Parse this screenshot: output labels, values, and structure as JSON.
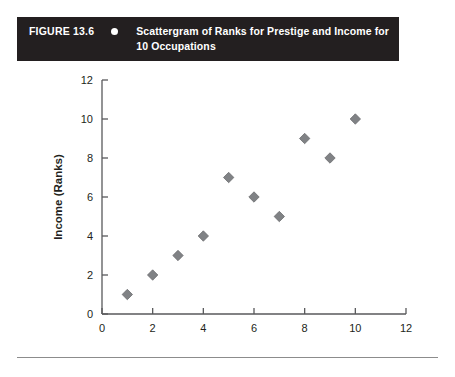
{
  "figure": {
    "number": "FIGURE 13.6",
    "bullet_icon": "bullet-dot-icon",
    "title": "Scattergram of Ranks for Prestige and Income for 10 Occupations"
  },
  "chart_data": {
    "type": "scatter",
    "title": "",
    "xlabel": "Prestige (Ranks)",
    "ylabel": "Income (Ranks)",
    "xlim": [
      0,
      12
    ],
    "ylim": [
      0,
      12
    ],
    "xticks": [
      0,
      2,
      4,
      6,
      8,
      10,
      12
    ],
    "yticks": [
      0,
      2,
      4,
      6,
      8,
      10,
      12
    ],
    "xtick_labels": [
      "0",
      "2",
      "4",
      "6",
      "8",
      "10",
      "12"
    ],
    "ytick_labels": [
      "0",
      "2",
      "4",
      "6",
      "8",
      "10",
      "12"
    ],
    "grid": false,
    "legend": false,
    "marker": "diamond",
    "marker_color": "#808285",
    "marker_edge_color": "#6d6e71",
    "series": [
      {
        "name": "Occupations",
        "points": [
          {
            "x": 1,
            "y": 1
          },
          {
            "x": 2,
            "y": 2
          },
          {
            "x": 3,
            "y": 3
          },
          {
            "x": 4,
            "y": 4
          },
          {
            "x": 5,
            "y": 7
          },
          {
            "x": 6,
            "y": 6
          },
          {
            "x": 7,
            "y": 5
          },
          {
            "x": 8,
            "y": 9
          },
          {
            "x": 9,
            "y": 8
          },
          {
            "x": 10,
            "y": 10
          }
        ]
      }
    ]
  },
  "colors": {
    "header_background": "#231f20",
    "header_text": "#ffffff",
    "axis": "#58595b",
    "marker": "#808285",
    "rule": "#8c8c8c"
  }
}
